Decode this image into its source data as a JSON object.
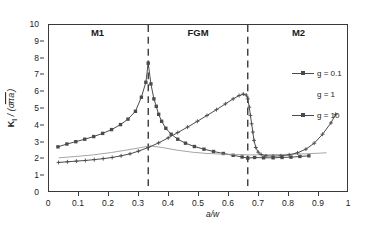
{
  "chart_data": {
    "type": "line",
    "title": "",
    "xlabel": "a/w",
    "ylabel": "K I / (σ√πa)",
    "ylabel_parts": {
      "symbol": "K",
      "subscript": "I",
      "denominator": "(σ√πa)"
    },
    "xlim": [
      0,
      1
    ],
    "ylim": [
      0,
      10
    ],
    "xticks": [
      "0",
      "0.1",
      "0.2",
      "0.3",
      "0.4",
      "0.5",
      "0.6",
      "0.7",
      "0.8",
      "0.9",
      "1"
    ],
    "xtick_values": [
      0,
      0.1,
      0.2,
      0.3,
      0.4,
      0.5,
      0.6,
      0.7,
      0.8,
      0.9,
      1
    ],
    "yticks": [
      "0",
      "1",
      "2",
      "3",
      "4",
      "5",
      "6",
      "7",
      "8",
      "9",
      "10"
    ],
    "ytick_values": [
      0,
      1,
      2,
      3,
      4,
      5,
      6,
      7,
      8,
      9,
      10
    ],
    "grid": false,
    "legend_position": "right-inside",
    "region_labels": [
      {
        "text": "M1",
        "x": 0.165
      },
      {
        "text": "FGM",
        "x": 0.5
      },
      {
        "text": "M2",
        "x": 0.835
      }
    ],
    "vertical_dashed_lines": [
      0.333,
      0.667
    ],
    "series": [
      {
        "name": "g = 0.1",
        "marker": "square",
        "color": "#4a4a4a",
        "points": [
          [
            0.03,
            2.66
          ],
          [
            0.06,
            2.83
          ],
          [
            0.09,
            2.97
          ],
          [
            0.12,
            3.12
          ],
          [
            0.15,
            3.28
          ],
          [
            0.18,
            3.47
          ],
          [
            0.21,
            3.7
          ],
          [
            0.24,
            4.0
          ],
          [
            0.265,
            4.33
          ],
          [
            0.29,
            4.8
          ],
          [
            0.31,
            5.65
          ],
          [
            0.325,
            6.55
          ],
          [
            0.333,
            7.7
          ],
          [
            0.342,
            6.45
          ],
          [
            0.352,
            5.55
          ],
          [
            0.36,
            5.1
          ],
          [
            0.368,
            4.62
          ],
          [
            0.378,
            4.2
          ],
          [
            0.392,
            3.78
          ],
          [
            0.41,
            3.42
          ],
          [
            0.432,
            3.12
          ],
          [
            0.458,
            2.88
          ],
          [
            0.488,
            2.68
          ],
          [
            0.52,
            2.52
          ],
          [
            0.552,
            2.38
          ],
          [
            0.585,
            2.26
          ],
          [
            0.618,
            2.15
          ],
          [
            0.648,
            2.05
          ],
          [
            0.667,
            1.98
          ],
          [
            0.69,
            2.02
          ],
          [
            0.72,
            2.0
          ],
          [
            0.752,
            2.0
          ],
          [
            0.782,
            2.02
          ],
          [
            0.812,
            2.04
          ],
          [
            0.842,
            2.08
          ],
          [
            0.872,
            2.12
          ]
        ]
      },
      {
        "name": "g = 1",
        "marker": "none",
        "color": "#9a9a9a",
        "points": [
          [
            0.034,
            2.0
          ],
          [
            0.09,
            2.08
          ],
          [
            0.15,
            2.18
          ],
          [
            0.21,
            2.32
          ],
          [
            0.265,
            2.48
          ],
          [
            0.31,
            2.62
          ],
          [
            0.34,
            2.72
          ],
          [
            0.38,
            2.62
          ],
          [
            0.43,
            2.46
          ],
          [
            0.48,
            2.34
          ],
          [
            0.53,
            2.26
          ],
          [
            0.58,
            2.22
          ],
          [
            0.63,
            2.2
          ],
          [
            0.667,
            2.18
          ],
          [
            0.72,
            2.18
          ],
          [
            0.79,
            2.2
          ],
          [
            0.86,
            2.24
          ],
          [
            0.93,
            2.3
          ]
        ]
      },
      {
        "name": "g = 10",
        "marker": "plus",
        "color": "#4a4a4a",
        "points": [
          [
            0.032,
            1.72
          ],
          [
            0.062,
            1.76
          ],
          [
            0.092,
            1.8
          ],
          [
            0.122,
            1.84
          ],
          [
            0.152,
            1.89
          ],
          [
            0.182,
            1.95
          ],
          [
            0.212,
            2.02
          ],
          [
            0.242,
            2.12
          ],
          [
            0.272,
            2.24
          ],
          [
            0.3,
            2.4
          ],
          [
            0.333,
            2.62
          ],
          [
            0.368,
            2.9
          ],
          [
            0.4,
            3.2
          ],
          [
            0.432,
            3.52
          ],
          [
            0.465,
            3.85
          ],
          [
            0.498,
            4.2
          ],
          [
            0.53,
            4.55
          ],
          [
            0.562,
            4.9
          ],
          [
            0.592,
            5.25
          ],
          [
            0.618,
            5.55
          ],
          [
            0.638,
            5.75
          ],
          [
            0.652,
            5.84
          ],
          [
            0.662,
            5.78
          ],
          [
            0.667,
            5.55
          ],
          [
            0.672,
            5.05
          ],
          [
            0.676,
            4.55
          ],
          [
            0.68,
            4.05
          ],
          [
            0.684,
            3.55
          ],
          [
            0.688,
            3.05
          ],
          [
            0.694,
            2.62
          ],
          [
            0.702,
            2.34
          ],
          [
            0.712,
            2.2
          ],
          [
            0.728,
            2.12
          ],
          [
            0.752,
            2.1
          ],
          [
            0.778,
            2.12
          ],
          [
            0.806,
            2.18
          ],
          [
            0.834,
            2.3
          ],
          [
            0.862,
            2.52
          ],
          [
            0.89,
            2.88
          ],
          [
            0.918,
            3.42
          ],
          [
            0.946,
            4.1
          ],
          [
            0.962,
            4.62
          ]
        ]
      }
    ],
    "legend": [
      {
        "label": "g = 0.1",
        "marker": "line-square"
      },
      {
        "label": "g = 1",
        "marker": "none"
      },
      {
        "label": "g = 10",
        "marker": "line-plus"
      }
    ]
  }
}
